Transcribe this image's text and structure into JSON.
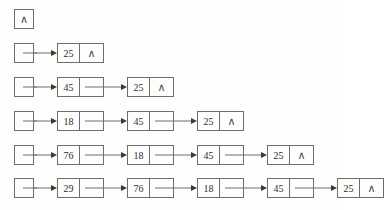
{
  "diagram": {
    "null_glyph": "∧",
    "colors": {
      "background": "#fdfdfc",
      "stroke": "#6e6e6e",
      "arrowhead": "#3a3a3a",
      "text": "#2e2e2e"
    },
    "geometry": {
      "head_box_left": 14,
      "node_start_left": 57,
      "node_pitch": 68,
      "node_width": 45,
      "row_tops": [
        8,
        42,
        76,
        110,
        144,
        177
      ]
    },
    "rows": [
      {
        "label": "row-1-empty-list",
        "head_is_null": true,
        "nodes": []
      },
      {
        "label": "row-2-one-node",
        "head_is_null": false,
        "nodes": [
          {
            "value": "25",
            "next_is_null": true
          }
        ]
      },
      {
        "label": "row-3-two-nodes",
        "head_is_null": false,
        "nodes": [
          {
            "value": "45",
            "next_is_null": false
          },
          {
            "value": "25",
            "next_is_null": true
          }
        ]
      },
      {
        "label": "row-4-three-nodes",
        "head_is_null": false,
        "nodes": [
          {
            "value": "18",
            "next_is_null": false
          },
          {
            "value": "45",
            "next_is_null": false
          },
          {
            "value": "25",
            "next_is_null": true
          }
        ]
      },
      {
        "label": "row-5-four-nodes",
        "head_is_null": false,
        "nodes": [
          {
            "value": "76",
            "next_is_null": false
          },
          {
            "value": "18",
            "next_is_null": false
          },
          {
            "value": "45",
            "next_is_null": false
          },
          {
            "value": "25",
            "next_is_null": true
          }
        ]
      },
      {
        "label": "row-6-five-nodes",
        "head_is_null": false,
        "nodes": [
          {
            "value": "29",
            "next_is_null": false
          },
          {
            "value": "76",
            "next_is_null": false
          },
          {
            "value": "18",
            "next_is_null": false
          },
          {
            "value": "45",
            "next_is_null": false
          },
          {
            "value": "25",
            "next_is_null": true
          }
        ]
      }
    ]
  }
}
